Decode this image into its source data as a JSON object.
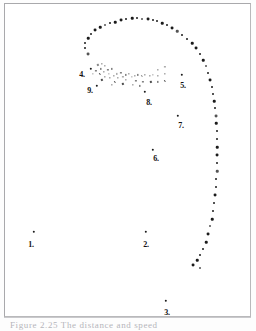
{
  "figure": {
    "title": "",
    "caption_prefix": "Figure 2.25",
    "caption_text": "The distance and speed",
    "caption_full": "Figure 2.25  The distance and speed"
  },
  "chart_data": {
    "type": "scatter",
    "title": "Figure 2.25",
    "xlabel": "",
    "ylabel": "",
    "xlim": [
      0,
      245
    ],
    "ylim": [
      0,
      312
    ],
    "grid": false,
    "legend": "none",
    "annotations": [
      {
        "label": "1.",
        "x": 26,
        "y": 241,
        "marker_x": 29,
        "marker_y": 228
      },
      {
        "label": "2.",
        "x": 141,
        "y": 241,
        "marker_x": 141,
        "marker_y": 228
      },
      {
        "label": "3.",
        "x": 162,
        "y": 309,
        "marker_x": 161,
        "marker_y": 297
      },
      {
        "label": "4.",
        "x": 77,
        "y": 71,
        "marker_x": 86,
        "marker_y": 65
      },
      {
        "label": "5.",
        "x": 178,
        "y": 82,
        "marker_x": 177,
        "marker_y": 71
      },
      {
        "label": "6.",
        "x": 151,
        "y": 155,
        "marker_x": 148,
        "marker_y": 146
      },
      {
        "label": "7.",
        "x": 176,
        "y": 122,
        "marker_x": 173,
        "marker_y": 112
      },
      {
        "label": "8.",
        "x": 144,
        "y": 99,
        "marker_x": 140,
        "marker_y": 88
      },
      {
        "label": "9.",
        "x": 85,
        "y": 87,
        "marker_x": 92,
        "marker_y": 82
      }
    ],
    "series": [
      {
        "name": "trajectory",
        "color": "#1b1b1b",
        "points": [
          [
            83,
            50
          ],
          [
            80,
            44
          ],
          [
            80,
            39
          ],
          [
            83,
            34
          ],
          [
            86,
            30
          ],
          [
            90,
            26
          ],
          [
            95,
            23
          ],
          [
            100,
            21
          ],
          [
            105,
            19
          ],
          [
            110,
            18
          ],
          [
            116,
            16
          ],
          [
            121,
            15
          ],
          [
            127,
            14
          ],
          [
            132,
            14
          ],
          [
            137,
            15
          ],
          [
            143,
            15
          ],
          [
            148,
            16
          ],
          [
            152,
            17
          ],
          [
            157,
            19
          ],
          [
            162,
            21
          ],
          [
            167,
            24
          ],
          [
            172,
            27
          ],
          [
            177,
            31
          ],
          [
            182,
            35
          ],
          [
            187,
            39
          ],
          [
            191,
            44
          ],
          [
            195,
            50
          ],
          [
            198,
            56
          ],
          [
            201,
            62
          ],
          [
            203,
            69
          ],
          [
            205,
            76
          ],
          [
            207,
            83
          ],
          [
            208,
            90
          ],
          [
            209,
            97
          ],
          [
            210,
            104
          ],
          [
            211,
            112
          ],
          [
            211,
            119
          ],
          [
            212,
            127
          ],
          [
            212,
            135
          ],
          [
            212,
            143
          ],
          [
            212,
            151
          ],
          [
            212,
            159
          ],
          [
            212,
            167
          ],
          [
            211,
            175
          ],
          [
            211,
            183
          ],
          [
            210,
            191
          ],
          [
            209,
            199
          ],
          [
            208,
            207
          ],
          [
            207,
            215
          ],
          [
            205,
            222
          ],
          [
            203,
            230
          ],
          [
            201,
            238
          ],
          [
            198,
            245
          ],
          [
            195,
            251
          ],
          [
            192,
            256
          ],
          [
            188,
            261
          ],
          [
            195,
            264
          ]
        ]
      }
    ],
    "cluster": {
      "name": "dense-marker-cluster",
      "color": "#2b2b2b",
      "points": [
        [
          93,
          61
        ],
        [
          97,
          60
        ],
        [
          100,
          62
        ],
        [
          96,
          65
        ],
        [
          91,
          67
        ],
        [
          88,
          70
        ],
        [
          95,
          70
        ],
        [
          99,
          68
        ],
        [
          103,
          66
        ],
        [
          107,
          65
        ],
        [
          104,
          70
        ],
        [
          100,
          73
        ],
        [
          97,
          76
        ],
        [
          105,
          74
        ],
        [
          109,
          72
        ],
        [
          112,
          70
        ],
        [
          116,
          69
        ],
        [
          113,
          74
        ],
        [
          110,
          78
        ],
        [
          107,
          81
        ],
        [
          118,
          73
        ],
        [
          121,
          71
        ],
        [
          124,
          70
        ],
        [
          121,
          76
        ],
        [
          118,
          80
        ],
        [
          127,
          73
        ],
        [
          130,
          72
        ],
        [
          133,
          71
        ],
        [
          131,
          77
        ],
        [
          128,
          81
        ],
        [
          137,
          72
        ],
        [
          140,
          71
        ],
        [
          138,
          78
        ],
        [
          135,
          82
        ],
        [
          145,
          72
        ],
        [
          148,
          71
        ],
        [
          146,
          78
        ],
        [
          153,
          66
        ],
        [
          153,
          72
        ],
        [
          153,
          78
        ],
        [
          160,
          63
        ],
        [
          160,
          70
        ],
        [
          160,
          77
        ]
      ]
    }
  },
  "colors": {
    "background": "#ffffff",
    "page": "#fdfdfd",
    "frame": "#b9b9bb",
    "marker": "#1b1b1b",
    "label_text": "#111111",
    "caption_text": "#b5b5bb",
    "rule": "#c9c9cc"
  }
}
